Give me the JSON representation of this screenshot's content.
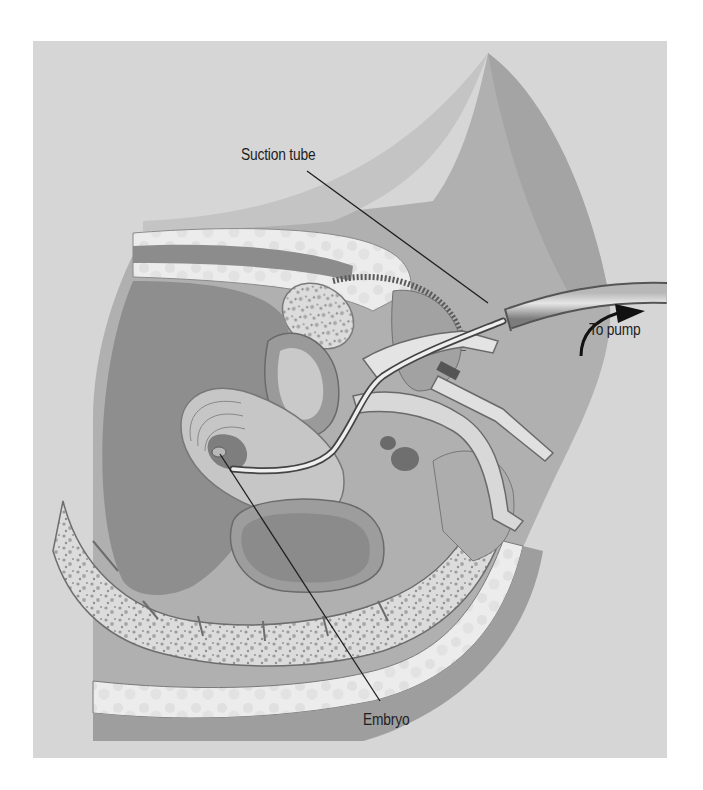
{
  "figure": {
    "colors": {
      "page_background": "#ffffff",
      "panel_background": "#d6d6d6",
      "body_silhouette": "#a9a9a9",
      "cavity_dark": "#8e8e8e",
      "bone_light": "#eeeeee",
      "bone_texture": "#a0a0a0",
      "tube_gray": "#9a9a9a",
      "leader_line": "#1e1e1e",
      "label_text": "#1e1e1e"
    },
    "labels": {
      "suction_tube": "Suction tube",
      "to_pump": "To pump",
      "embryo": "Embryo"
    },
    "annotations": [
      {
        "id": "suction_tube",
        "text": "Suction tube",
        "points_to": "thin cannula near speculum"
      },
      {
        "id": "to_pump",
        "text": "To pump",
        "points_to": "direction arrow at tube end"
      },
      {
        "id": "embryo",
        "text": "Embryo",
        "points_to": "small structure inside uterus at cannula tip"
      }
    ]
  }
}
